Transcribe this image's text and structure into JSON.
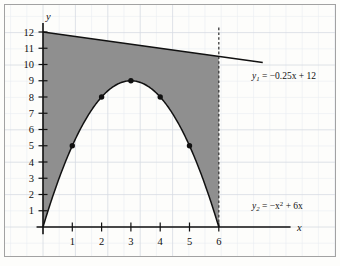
{
  "figure": {
    "title": "",
    "background_color": "#fdfdfb",
    "grid_color": "#d8dce4",
    "grid_minor_color": "#e8ebf0",
    "shade_color": "#8d8d8d",
    "curve_color": "#1a1a1a",
    "axis_color": "#1a1a1a",
    "border_color": "#9a9a9a"
  },
  "axes": {
    "x_label": "x",
    "y_label": "y",
    "x_ticks": [
      "1",
      "2",
      "3",
      "4",
      "5",
      "6"
    ],
    "y_ticks": [
      "1",
      "2",
      "3",
      "4",
      "5",
      "6",
      "7",
      "8",
      "9",
      "10",
      "11",
      "12"
    ],
    "x_range": [
      0,
      6
    ],
    "y_range": [
      0,
      12
    ]
  },
  "labels": {
    "line_equation": {
      "var": "y",
      "sub": "1",
      "rhs": " = −0.25x + 12",
      "full": "y₁ = −0.25x + 12"
    },
    "parabola_equation": {
      "var": "y",
      "sub": "2",
      "rhs_pre": " = −x",
      "sup": "2",
      "rhs_post": " + 6x",
      "full": "y₂ = −x² + 6x"
    }
  },
  "chart_data": {
    "type": "line",
    "title": "",
    "xlabel": "x",
    "ylabel": "y",
    "xlim": [
      0,
      6
    ],
    "ylim": [
      0,
      12
    ],
    "grid": true,
    "legend": "inline-annotations",
    "series": [
      {
        "name": "y1 = -0.25x + 12",
        "equation": "y = -0.25x + 12",
        "kind": "line",
        "x": [
          0,
          1,
          2,
          3,
          4,
          5,
          6
        ],
        "values": [
          12,
          11.75,
          11.5,
          11.25,
          11,
          10.75,
          10.5
        ],
        "draw_extension_to_x": 7.5
      },
      {
        "name": "y2 = -x^2 + 6x",
        "equation": "y = -x^2 + 6x",
        "kind": "parabola",
        "x": [
          0,
          0.5,
          1,
          1.5,
          2,
          2.5,
          3,
          3.5,
          4,
          4.5,
          5,
          5.5,
          6
        ],
        "values": [
          0,
          2.75,
          5,
          6.75,
          8,
          8.75,
          9,
          8.75,
          8,
          6.75,
          5,
          2.75,
          0
        ]
      }
    ],
    "marked_points": [
      {
        "x": 1,
        "y": 5
      },
      {
        "x": 2,
        "y": 8
      },
      {
        "x": 3,
        "y": 9
      },
      {
        "x": 4,
        "y": 8
      },
      {
        "x": 5,
        "y": 5
      }
    ],
    "shaded_region": {
      "description": "Area between y1 and y2 from x=0 to x=6",
      "upper": "y1 = -0.25x + 12",
      "lower": "y2 = -x^2 + 6x",
      "x_from": 0,
      "x_to": 6
    },
    "dashed_vertical": {
      "x": 6,
      "y_from": 0,
      "y_to": 12.3
    }
  }
}
